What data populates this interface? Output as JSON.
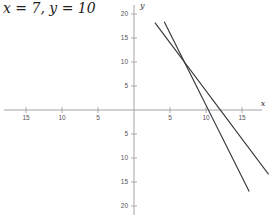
{
  "title": "x = 7, y = 10",
  "chart_data": {
    "type": "line",
    "title": "x = 7, y = 10",
    "xlabel": "x",
    "ylabel": "y",
    "xlim": [
      -18.5,
      18.5
    ],
    "ylim": [
      -22,
      22.5
    ],
    "x_ticks": [
      -15,
      -10,
      -5,
      5,
      10,
      15
    ],
    "x_tick_labels": [
      "15",
      "10",
      "5",
      "5",
      "10",
      "15"
    ],
    "y_ticks": [
      20,
      15,
      10,
      5,
      -5,
      -10,
      -15,
      -20
    ],
    "y_tick_labels": [
      "20",
      "15",
      "10",
      "5",
      "5",
      "10",
      "15",
      "20"
    ],
    "grid": false,
    "series": [
      {
        "name": "line 1",
        "equation": "y = -3x + 31",
        "x": [
          4.2,
          16
        ],
        "y": [
          18.4,
          -17
        ]
      },
      {
        "name": "line 2",
        "equation": "y = -2x + 24",
        "x": [
          2.9,
          18.7
        ],
        "y": [
          18.2,
          -13.4
        ]
      }
    ],
    "intersection": {
      "x": 7,
      "y": 10
    },
    "colors": {
      "axis": "#999999",
      "lines": "#333333"
    }
  }
}
